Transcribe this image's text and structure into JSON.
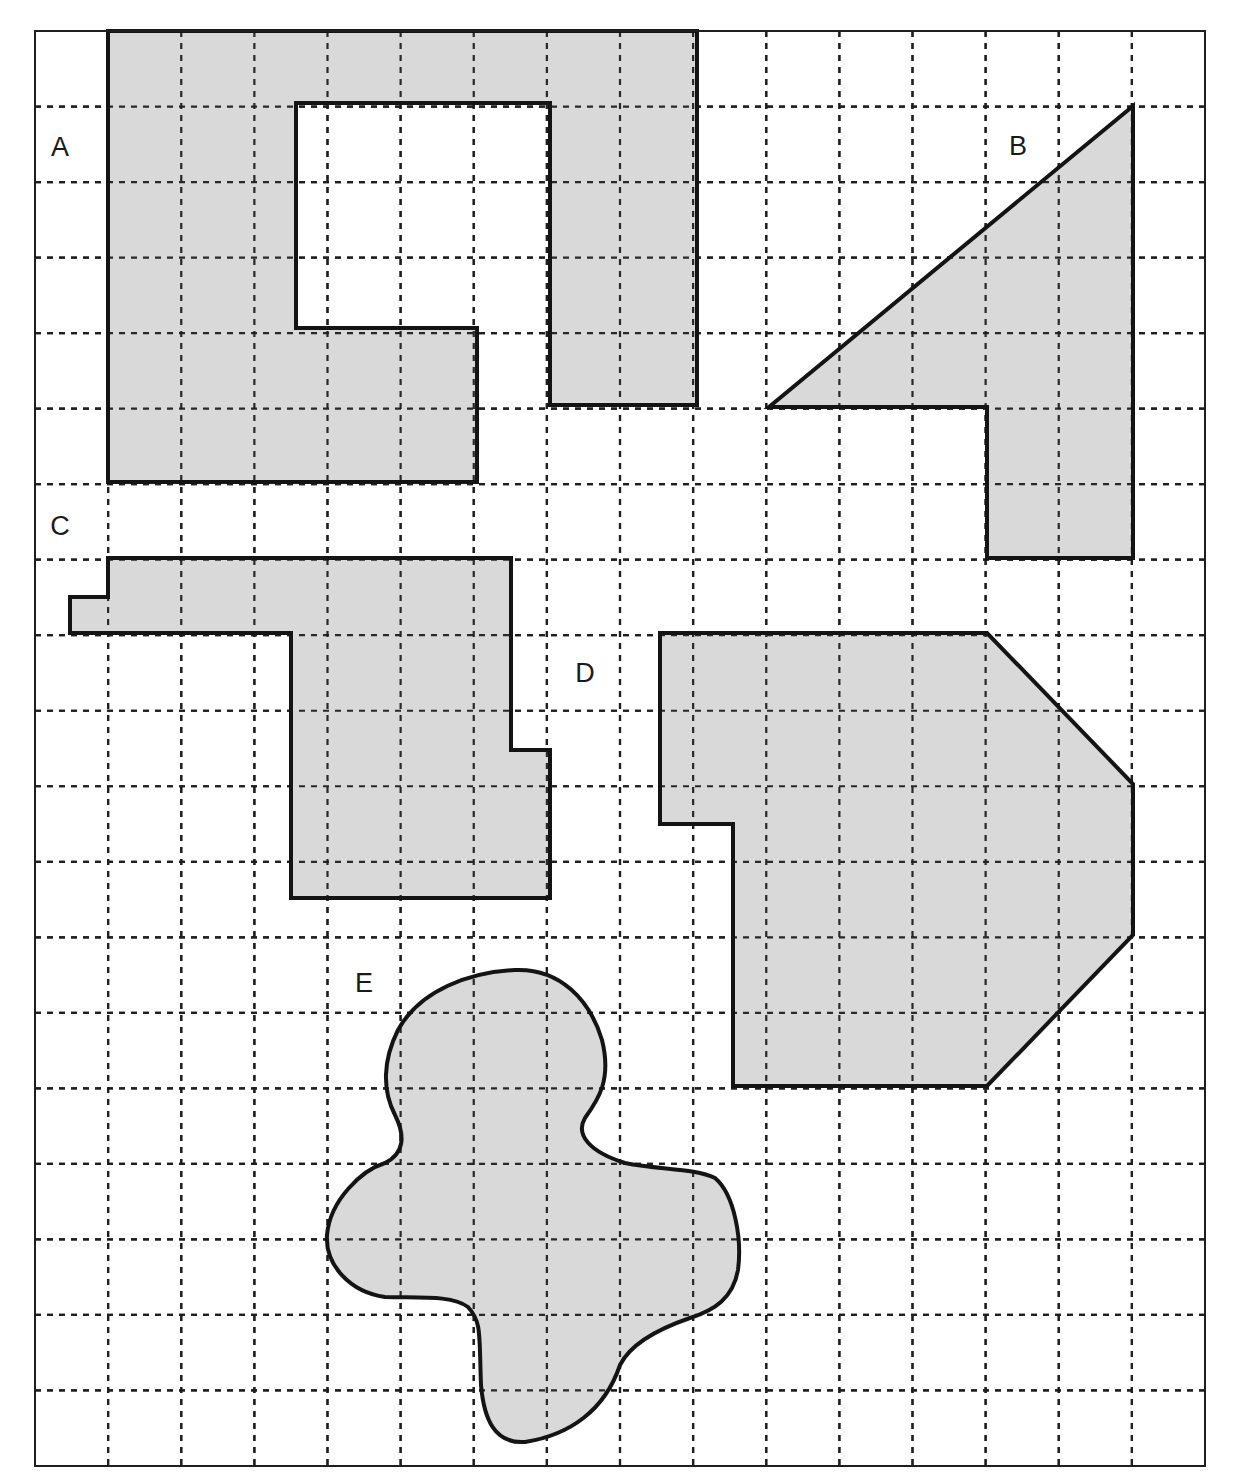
{
  "figure": {
    "frame": {
      "x": 35,
      "y": 31,
      "width": 1170,
      "height": 1435
    },
    "grid": {
      "columns": 16,
      "rows": 19,
      "line_style": "dashed"
    },
    "colors": {
      "fill": "#d9d9d9",
      "stroke": "#141414",
      "grid": "#1f1f1f",
      "background": "#ffffff"
    }
  },
  "shapes": [
    {
      "id": "A",
      "label": "A",
      "label_pos": [
        60,
        156
      ],
      "kind": "polygon-with-notch",
      "points": [
        [
          108,
          31
        ],
        [
          697,
          31
        ],
        [
          697,
          405
        ],
        [
          550,
          405
        ],
        [
          550,
          103
        ],
        [
          296,
          103
        ],
        [
          296,
          328
        ],
        [
          477,
          328
        ],
        [
          477,
          482
        ],
        [
          108,
          482
        ]
      ]
    },
    {
      "id": "B",
      "label": "B",
      "label_pos": [
        1018,
        155
      ],
      "kind": "polygon",
      "points": [
        [
          1133,
          106
        ],
        [
          1133,
          558
        ],
        [
          987,
          558
        ],
        [
          987,
          407
        ],
        [
          769,
          407
        ]
      ]
    },
    {
      "id": "C",
      "label": "C",
      "label_pos": [
        60,
        535
      ],
      "kind": "polygon",
      "points": [
        [
          108,
          558
        ],
        [
          511,
          558
        ],
        [
          511,
          750
        ],
        [
          550,
          750
        ],
        [
          550,
          898
        ],
        [
          291,
          898
        ],
        [
          291,
          633
        ],
        [
          70,
          633
        ],
        [
          70,
          597
        ],
        [
          108,
          597
        ]
      ]
    },
    {
      "id": "D",
      "label": "D",
      "label_pos": [
        585,
        682
      ],
      "kind": "polygon",
      "points": [
        [
          660,
          633
        ],
        [
          987,
          633
        ],
        [
          1133,
          784
        ],
        [
          1133,
          935
        ],
        [
          987,
          1086
        ],
        [
          733,
          1086
        ],
        [
          733,
          824
        ],
        [
          660,
          824
        ]
      ]
    },
    {
      "id": "E",
      "label": "E",
      "label_pos": [
        364,
        992
      ],
      "kind": "freeform-blob",
      "path": "M 515 970 C 560 968, 590 1000, 602 1040 C 612 1080, 598 1100, 585 1118 C 575 1135, 590 1152, 625 1163 C 660 1170, 695 1168, 715 1178 C 735 1195, 742 1240, 738 1270 C 733 1298, 715 1310, 690 1318 C 655 1330, 630 1345, 620 1365 C 605 1410, 570 1435, 525 1442 C 495 1444, 484 1420, 481 1385 C 479 1335, 482 1322, 468 1307 C 452 1295, 420 1298, 385 1297 C 350 1292, 325 1265, 327 1235 C 330 1200, 362 1170, 385 1163 C 405 1153, 405 1135, 395 1115 C 382 1090, 383 1060, 398 1030 C 420 990, 470 972, 515 970 Z"
    }
  ]
}
